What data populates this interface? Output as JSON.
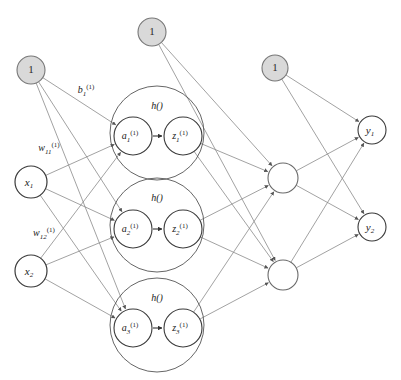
{
  "diagram": {
    "type": "neural-network-architecture",
    "title": "",
    "background_color": "#ffffff",
    "colors": {
      "bias_fill": "#d9d9d9",
      "node_fill": "#ffffff",
      "node_stroke": "#555555",
      "bias_stroke": "#777777",
      "edge_stroke": "#8a8a8a",
      "inner_stroke": "#444444",
      "text": "#1a1a1a"
    },
    "bias_nodes": [
      {
        "id": "bias-input",
        "label": "1",
        "cx": 31,
        "cy": 70,
        "r": 14
      },
      {
        "id": "bias-hidden",
        "label": "1",
        "cx": 152,
        "cy": 32,
        "r": 14
      },
      {
        "id": "bias-output",
        "label": "1",
        "cx": 275,
        "cy": 68,
        "r": 13
      }
    ],
    "input_nodes": [
      {
        "id": "x1",
        "label": "x",
        "sub": "1",
        "sup": "",
        "cx": 31,
        "cy": 182,
        "r": 16
      },
      {
        "id": "x2",
        "label": "x",
        "sub": "2",
        "sup": "",
        "cx": 31,
        "cy": 271,
        "r": 16
      }
    ],
    "hidden_units": [
      {
        "id": "h1",
        "cx": 157,
        "cy": 133,
        "outer_r": 47,
        "activation_label": "h()",
        "pre": {
          "label": "a",
          "sub": "1",
          "sup": "(1)",
          "cx": 133,
          "cy": 136,
          "r": 19
        },
        "post": {
          "label": "z",
          "sub": "1",
          "sup": "(1)",
          "cx": 183,
          "cy": 136,
          "r": 19
        }
      },
      {
        "id": "h2",
        "cx": 157,
        "cy": 225,
        "outer_r": 47,
        "activation_label": "h()",
        "pre": {
          "label": "a",
          "sub": "2",
          "sup": "(1)",
          "cx": 133,
          "cy": 229,
          "r": 19
        },
        "post": {
          "label": "z",
          "sub": "2",
          "sup": "(1)",
          "cx": 183,
          "cy": 229,
          "r": 19
        }
      },
      {
        "id": "h3",
        "cx": 157,
        "cy": 325,
        "outer_r": 47,
        "activation_label": "h()",
        "pre": {
          "label": "a",
          "sub": "3",
          "sup": "(1)",
          "cx": 133,
          "cy": 328,
          "r": 19
        },
        "post": {
          "label": "z",
          "sub": "3",
          "sup": "(1)",
          "cx": 183,
          "cy": 328,
          "r": 19
        }
      }
    ],
    "middle_nodes": [
      {
        "id": "m1",
        "label": "",
        "cx": 283,
        "cy": 178,
        "r": 15
      },
      {
        "id": "m2",
        "label": "",
        "cx": 283,
        "cy": 275,
        "r": 15
      }
    ],
    "output_nodes": [
      {
        "id": "y1",
        "label": "y",
        "sub": "1",
        "sup": "",
        "cx": 372,
        "cy": 130,
        "r": 14
      },
      {
        "id": "y2",
        "label": "y",
        "sub": "2",
        "sup": "",
        "cx": 372,
        "cy": 227,
        "r": 14
      }
    ],
    "edge_labels": [
      {
        "id": "bias-weight-1",
        "base": "b",
        "sub": "1",
        "sup": "(1)",
        "x": 86,
        "y": 91
      },
      {
        "id": "weight-11",
        "base": "w",
        "sub": "11",
        "sup": "(1)",
        "x": 49,
        "y": 149
      },
      {
        "id": "weight-12",
        "base": "w",
        "sub": "12",
        "sup": "(1)",
        "x": 44,
        "y": 234
      }
    ],
    "edges": [
      {
        "from": "bias-input",
        "to": "h1.pre"
      },
      {
        "from": "bias-input",
        "to": "h2.pre"
      },
      {
        "from": "bias-input",
        "to": "h3.pre"
      },
      {
        "from": "x1",
        "to": "h1.pre"
      },
      {
        "from": "x1",
        "to": "h2.pre"
      },
      {
        "from": "x1",
        "to": "h3.pre"
      },
      {
        "from": "x2",
        "to": "h1.pre"
      },
      {
        "from": "x2",
        "to": "h2.pre"
      },
      {
        "from": "x2",
        "to": "h3.pre"
      },
      {
        "from": "bias-hidden",
        "to": "m1"
      },
      {
        "from": "bias-hidden",
        "to": "m2"
      },
      {
        "from": "h1.post",
        "to": "m1"
      },
      {
        "from": "h1.post",
        "to": "m2"
      },
      {
        "from": "h2.post",
        "to": "m1"
      },
      {
        "from": "h2.post",
        "to": "m2"
      },
      {
        "from": "h3.post",
        "to": "m1"
      },
      {
        "from": "h3.post",
        "to": "m2"
      },
      {
        "from": "bias-output",
        "to": "y1"
      },
      {
        "from": "bias-output",
        "to": "y2"
      },
      {
        "from": "m1",
        "to": "y1"
      },
      {
        "from": "m1",
        "to": "y2"
      },
      {
        "from": "m2",
        "to": "y1"
      },
      {
        "from": "m2",
        "to": "y2"
      }
    ]
  }
}
